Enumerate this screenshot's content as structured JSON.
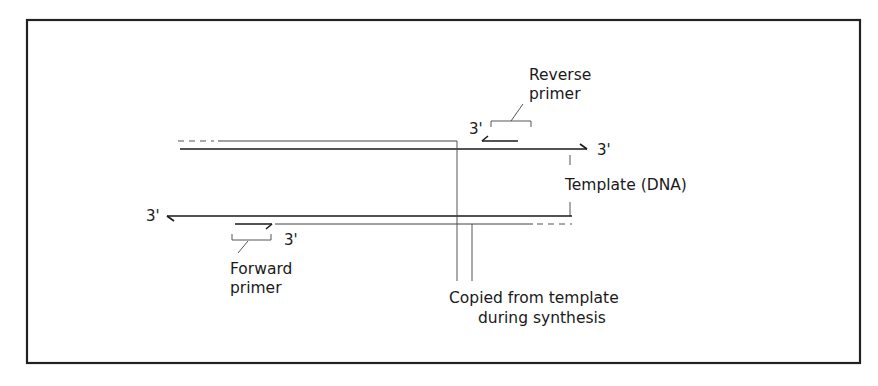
{
  "diagram": {
    "type": "PCR primer annealing schematic",
    "labels": {
      "reverse_primer_line1": "Reverse",
      "reverse_primer_line2": "primer",
      "forward_primer_line1": "Forward",
      "forward_primer_line2": "primer",
      "template": "Template (DNA)",
      "copied_line1": "Copied from template",
      "copied_line2": "during synthesis",
      "three_prime": "3'"
    },
    "strands": [
      {
        "id": "template-top",
        "end_label": "3'",
        "direction": "right"
      },
      {
        "id": "template-bottom",
        "end_label": "3'",
        "direction": "left"
      },
      {
        "id": "reverse-primer",
        "end_label": "3'",
        "direction": "left"
      },
      {
        "id": "forward-primer",
        "end_label": "3'",
        "direction": "right"
      }
    ],
    "colors": {
      "line": "#1a1a1a",
      "frame": "#222222",
      "background": "#ffffff"
    }
  }
}
